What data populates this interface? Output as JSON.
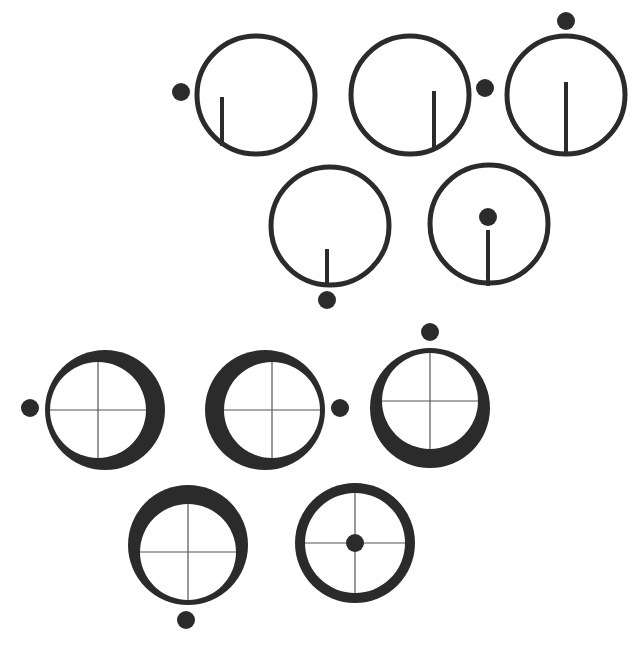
{
  "figure": {
    "width": 642,
    "height": 649,
    "colors": {
      "ink": "#2b2b2b",
      "background": "#ffffff",
      "crosshair": "#555555"
    },
    "top_group": {
      "description": "Thin-ring circles with a vertical stick and an external/internal dot",
      "items": [
        {
          "id": "t1",
          "cx": 256,
          "cy": 95,
          "r": 59,
          "dot": [
            181,
            92
          ],
          "stick": [
            222,
            97,
            222,
            146
          ]
        },
        {
          "id": "t2",
          "cx": 410,
          "cy": 95,
          "r": 59,
          "dot": [
            485,
            88
          ],
          "stick": [
            434,
            91,
            434,
            150
          ]
        },
        {
          "id": "t3",
          "cx": 566,
          "cy": 95,
          "r": 59,
          "dot": [
            566,
            21
          ],
          "stick": [
            566,
            82,
            566,
            154
          ]
        },
        {
          "id": "t4",
          "cx": 330,
          "cy": 226,
          "r": 59,
          "dot": [
            327,
            300
          ],
          "stick": [
            327,
            249,
            327,
            286
          ]
        },
        {
          "id": "t5",
          "cx": 489,
          "cy": 224,
          "r": 59,
          "dot": [
            488,
            217
          ],
          "stick": [
            488,
            230,
            488,
            286
          ]
        }
      ]
    },
    "bottom_group": {
      "description": "Thick crescent rings with crosshairs and a dot indicating the thin side",
      "items": [
        {
          "id": "b1",
          "cx": 105,
          "cy": 410,
          "r": 60,
          "dot": [
            30,
            408
          ],
          "thick_side": "right"
        },
        {
          "id": "b2",
          "cx": 265,
          "cy": 410,
          "r": 60,
          "dot": [
            340,
            408
          ],
          "thick_side": "left"
        },
        {
          "id": "b3",
          "cx": 430,
          "cy": 408,
          "r": 60,
          "dot": [
            430,
            332
          ],
          "thick_side": "bottom"
        },
        {
          "id": "b4",
          "cx": 188,
          "cy": 545,
          "r": 60,
          "dot": [
            186,
            620
          ],
          "thick_side": "top"
        },
        {
          "id": "b5",
          "cx": 355,
          "cy": 543,
          "r": 60,
          "dot": [
            355,
            543
          ],
          "thick_side": "none"
        }
      ]
    }
  }
}
